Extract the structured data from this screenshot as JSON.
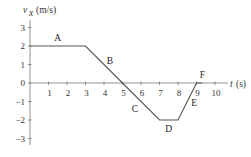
{
  "chart_data": {
    "type": "line",
    "title": "",
    "xlabel": "t (s)",
    "ylabel": "v_x (m/s)",
    "ylabel_main": "v",
    "ylabel_sub": "x",
    "ylabel_unit": "(m/s)",
    "xlim": [
      0,
      10
    ],
    "ylim": [
      -3,
      3
    ],
    "grid": false,
    "x_ticks": [
      1,
      2,
      3,
      4,
      5,
      6,
      7,
      8,
      9,
      10
    ],
    "y_ticks": [
      3,
      2,
      1,
      0,
      -1,
      -2,
      -3
    ],
    "y_tick_labels": [
      "3",
      "2",
      "1",
      "0",
      "−1",
      "−2",
      "−3"
    ],
    "x": [
      0,
      3,
      5,
      7,
      8,
      9,
      9.3
    ],
    "y": [
      2,
      2,
      0,
      -2,
      -2,
      0,
      0
    ],
    "segments": [
      {
        "label": "A",
        "from": [
          0,
          2
        ],
        "to": [
          3,
          2
        ]
      },
      {
        "label": "B",
        "from": [
          3,
          2
        ],
        "to": [
          5,
          0
        ]
      },
      {
        "label": "C",
        "from": [
          5,
          0
        ],
        "to": [
          7,
          -2
        ]
      },
      {
        "label": "D",
        "from": [
          7,
          -2
        ],
        "to": [
          8,
          -2
        ]
      },
      {
        "label": "E",
        "from": [
          8,
          -2
        ],
        "to": [
          9,
          0
        ]
      },
      {
        "label": "F",
        "from": [
          9,
          0
        ],
        "to": [
          9.3,
          0
        ]
      }
    ],
    "colors": {
      "line": "#555555",
      "axis": "#666666",
      "text": "#333333"
    }
  }
}
